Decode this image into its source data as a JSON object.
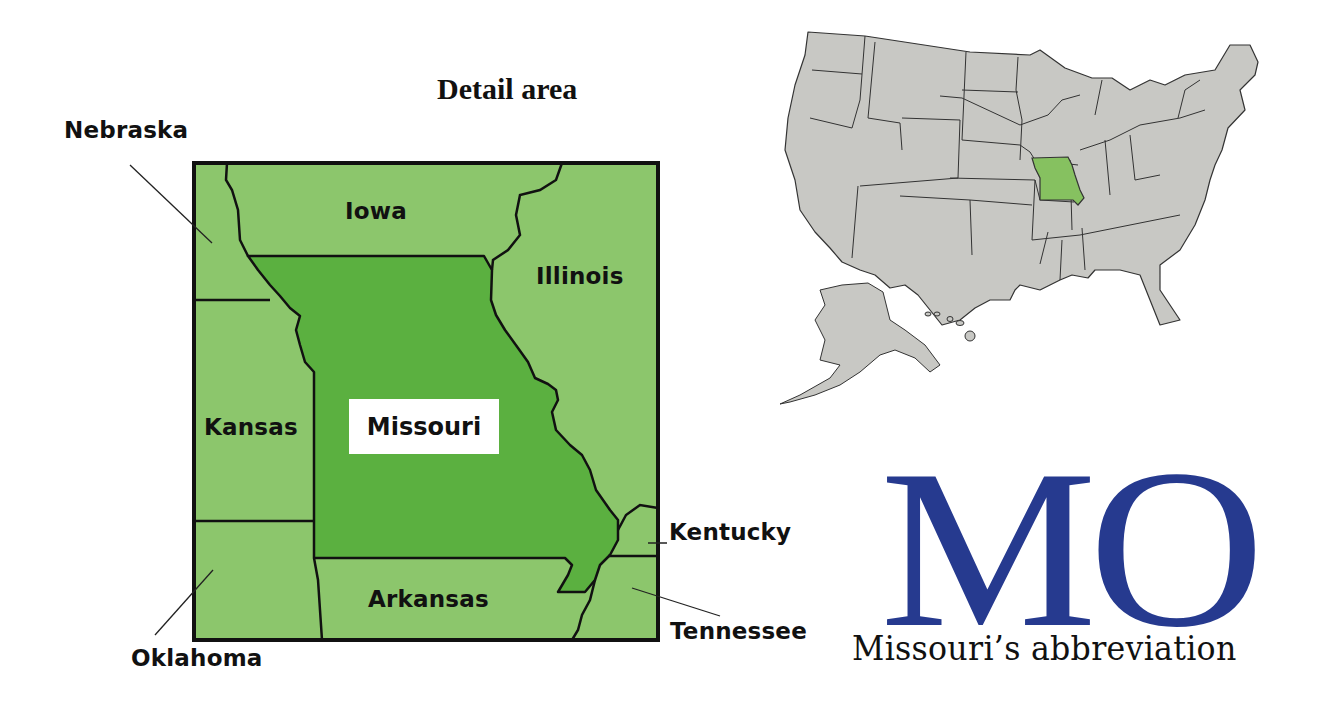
{
  "title": "Detail area",
  "detail_map": {
    "colors": {
      "focus_state": "#5bb040",
      "neighbor_state": "#8cc66c",
      "border": "#111111",
      "label_box": "#ffffff"
    },
    "focus_state": "Missouri",
    "neighbor_labels": {
      "nebraska": "Nebraska",
      "iowa": "Iowa",
      "illinois": "Illinois",
      "kansas": "Kansas",
      "kentucky": "Kentucky",
      "arkansas": "Arkansas",
      "tennessee": "Tennessee",
      "oklahoma": "Oklahoma"
    }
  },
  "locator_map": {
    "colors": {
      "states": "#c8c8c4",
      "highlight": "#86c160",
      "border": "#333333"
    },
    "highlighted_state": "Missouri"
  },
  "abbreviation": {
    "code": "MO",
    "caption": "Missouri’s abbreviation",
    "color": "#263a8f"
  }
}
